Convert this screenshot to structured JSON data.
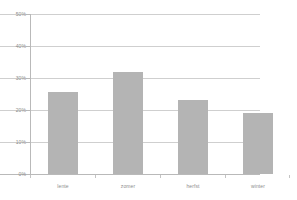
{
  "chart_data": {
    "type": "bar",
    "title": "",
    "xlabel": "",
    "ylabel": "",
    "categories": [
      "lente",
      "zomer",
      "herfst",
      "winter"
    ],
    "values": [
      25.5,
      32.0,
      23.0,
      19.0
    ],
    "ylim": [
      0,
      50
    ],
    "yticks": [
      0,
      10,
      20,
      30,
      40,
      50
    ],
    "ytick_labels": [
      "0%",
      "10%",
      "20%",
      "30%",
      "40%",
      "50%"
    ],
    "grid": true,
    "legend": false,
    "series": [
      {
        "name": "",
        "values": [
          25.5,
          32.0,
          23.0,
          19.0
        ]
      }
    ],
    "colors": {
      "bar_fill": "#b4b4b4",
      "gridline": "#cfcfcf",
      "axis": "#b9b9b9",
      "tick_text": "#8d8d8d",
      "background": "#ffffff"
    }
  }
}
